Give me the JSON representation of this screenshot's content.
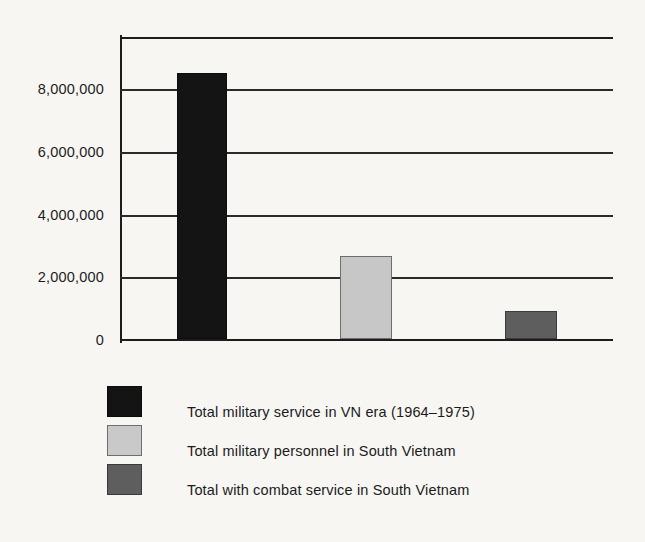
{
  "chart_data": {
    "type": "bar",
    "title": "",
    "subtitle": "",
    "xlabel": "",
    "ylabel": "",
    "categories": [
      "Total military service in VN era (1964–1975)",
      "Total military personnel in South Vietnam",
      "Total with combat service in South Vietnam"
    ],
    "values": [
      8500000,
      2650000,
      900000
    ],
    "ylim": [
      0,
      9700000
    ],
    "yticks": [
      0,
      2000000,
      4000000,
      6000000,
      8000000
    ],
    "ytick_labels": [
      "0",
      "2,000,000",
      "4,000,000",
      "6,000,000",
      "8,000,000"
    ],
    "xtick_labels": [],
    "grid": "horizontal",
    "legend_position": "below",
    "colors": [
      "#141414",
      "#c9c9c9",
      "#5e5e5e"
    ],
    "background": "#f7f6f3",
    "axis_color": "#1c1c1c"
  },
  "axis": {
    "ticks": [
      {
        "label": "8,000,000",
        "value": 8000000
      },
      {
        "label": "6,000,000",
        "value": 6000000
      },
      {
        "label": "4,000,000",
        "value": 4000000
      },
      {
        "label": "2,000,000",
        "value": 2000000
      },
      {
        "label": "0",
        "value": 0
      }
    ]
  },
  "bars": [
    {
      "name": "bar-total-military-service",
      "value": 8500000,
      "style": "dark"
    },
    {
      "name": "bar-total-personnel-south-vietnam",
      "value": 2650000,
      "style": "light"
    },
    {
      "name": "bar-total-combat-service",
      "value": 900000,
      "style": "mid"
    }
  ],
  "legend": {
    "items": [
      {
        "label": "Total military service in VN era (1964–1975)",
        "style": "dark",
        "color": "#141414"
      },
      {
        "label": "Total military personnel in South Vietnam",
        "style": "light",
        "color": "#c9c9c9"
      },
      {
        "label": "Total with combat service in South Vietnam",
        "style": "mid",
        "color": "#5e5e5e"
      }
    ]
  }
}
